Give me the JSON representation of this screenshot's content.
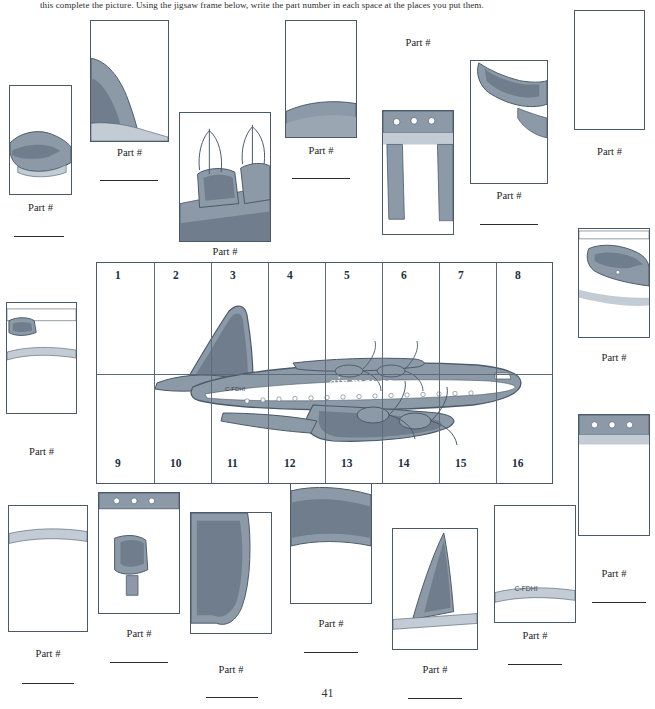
{
  "document": {
    "instruction": "this complete the picture. Using the jigsaw frame below, write the part number in each space at the places you put them.",
    "page_number": "41",
    "part_label": "Part #"
  },
  "colors": {
    "outline": "#4a5a6a",
    "body_fill": "#8c99a6",
    "body_shade": "#6f7d8c",
    "light_fill": "#c3ccd4",
    "paper": "#ffffff",
    "text": "#1b1b1b"
  },
  "main_figure": {
    "name": "air-mouse-airliner-jigsaw-frame",
    "airline_text": "air mouse",
    "registration_text": "C-FDHI",
    "grid_numbers_top": [
      "1",
      "2",
      "3",
      "4",
      "5",
      "6",
      "7",
      "8"
    ],
    "grid_numbers_bottom": [
      "9",
      "10",
      "11",
      "12",
      "13",
      "14",
      "15",
      "16"
    ]
  },
  "pieces": [
    {
      "id": "piece-top-left-nose",
      "label": "Part #",
      "content": "aircraft nose section"
    },
    {
      "id": "piece-tail-fin",
      "label": "Part #",
      "content": "tail fin shading"
    },
    {
      "id": "piece-engine-props",
      "label": "Part #",
      "content": "engines and propellers"
    },
    {
      "id": "piece-upper-fuselage",
      "label": "Part #",
      "content": "upper fuselage curve"
    },
    {
      "id": "piece-wing-windows",
      "label": "Part #",
      "content": "wing with cabin windows"
    },
    {
      "id": "piece-wing-tip",
      "label": "Part #",
      "content": "wing tip"
    },
    {
      "id": "piece-blank-upper-right",
      "label": "Part #",
      "content": "blank sky area"
    },
    {
      "id": "piece-tailplane",
      "label": "Part #",
      "content": "tailplane and rudder"
    },
    {
      "id": "piece-left-nose-low",
      "label": "Part #",
      "content": "nose and cockpit"
    },
    {
      "id": "piece-window-strip",
      "label": "Part #",
      "content": "fuselage window strip"
    },
    {
      "id": "piece-lower-wing-left",
      "label": "Part #",
      "content": "lower wing left"
    },
    {
      "id": "piece-undercarriage",
      "label": "Part #",
      "content": "undercarriage and nacelle"
    },
    {
      "id": "piece-lower-wing-mid",
      "label": "Part #",
      "content": "lower wing centre"
    },
    {
      "id": "piece-rear-wing",
      "label": "Part #",
      "content": "rear wing section"
    },
    {
      "id": "piece-tail-logo",
      "label": "Part #",
      "content": "tail with air mouse logo"
    },
    {
      "id": "piece-nose-registration",
      "label": "Part #",
      "content": "nose with registration"
    }
  ]
}
